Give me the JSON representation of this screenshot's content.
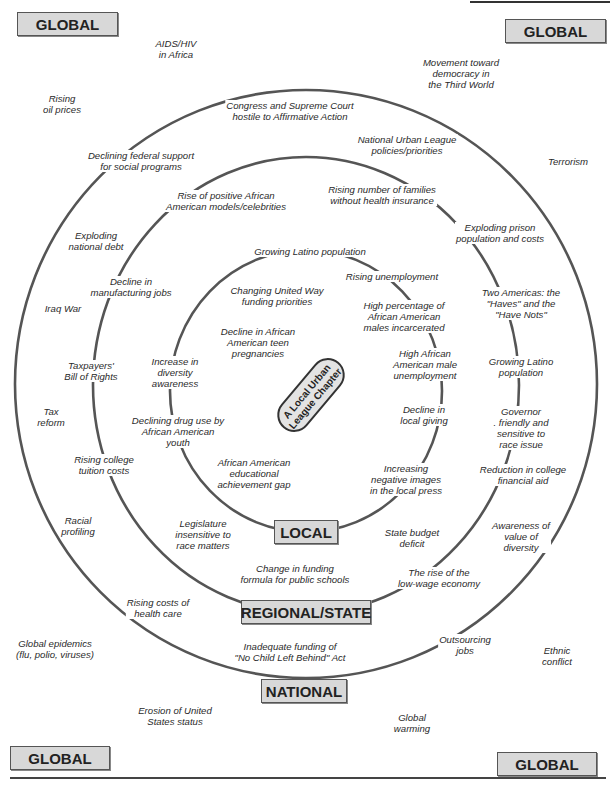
{
  "center": {
    "label": "A Local Urban\nLeague Chapter"
  },
  "levels": {
    "local": "LOCAL",
    "regional": "REGIONAL/STATE",
    "national": "NATIONAL",
    "global": "GLOBAL"
  },
  "global_boxes": [
    {
      "id": "top-left",
      "label": "GLOBAL"
    },
    {
      "id": "top-right",
      "label": "GLOBAL"
    },
    {
      "id": "bottom-left",
      "label": "GLOBAL"
    },
    {
      "id": "bottom-right",
      "label": "GLOBAL"
    }
  ],
  "factors": {
    "local": [
      "Growing Latino population",
      "Changing United Way\nfunding priorities",
      "Decline in African\nAmerican teen\npregnancies",
      "Increase in\ndiversity\nawareness",
      "Declining drug use by\nAfrican American\nyouth",
      "African American\neducational\nachievement gap",
      "Rising unemployment",
      "High percentage of\nAfrican American\nmales incarcerated",
      "High African\nAmerican male\nunemployment",
      "Decline in\nlocal giving",
      "Increasing\nnegative images\nin the local press"
    ],
    "regional": [
      "Rise of positive African\nAmerican models/celebrities",
      "Decline in\nmanufacturing jobs",
      "Taxpayers'\nBill of Rights",
      "Rising college\ntuition costs",
      "Legislature\ninsensitive to\nrace matters",
      "Change in funding\nformula for public schools",
      "State budget\ndeficit",
      "Rising number of families\nwithout health insurance",
      "Exploding prison\npopulation and costs",
      "Two Americas: the\n\"Haves\" and the\n\"Have Nots\"",
      "Growing Latino\npopulation",
      "Governor\n. friendly and\nsensitive to\nrace issue",
      "Reduction in college\nfinancial aid",
      "The rise of the\nlow-wage economy"
    ],
    "national": [
      "Congress and Supreme Court\nhostile to Affirmative Action",
      "Declining federal support\nfor social programs",
      "Exploding\nnational debt",
      "Iraq War",
      "Tax\nreform",
      "Racial\nprofiling",
      "Rising costs of\nhealth care",
      "Inadequate funding of\n\"No Child Left Behind\" Act",
      "National Urban League\npolicies/priorities",
      "Awareness of\nvalue of\ndiversity",
      "Outsourcing\njobs"
    ],
    "global": [
      "AIDS/HIV\nin Africa",
      "Rising\noil prices",
      "Movement toward\ndemocracy in\nthe Third World",
      "Terrorism",
      "Global epidemics\n(flu, polio, viruses)",
      "Erosion of United\nStates status",
      "Global\nwarming",
      "Ethnic\nconflict"
    ]
  },
  "colors": {
    "box_fill": "#d8d8d8",
    "ring_stroke": "#555555",
    "text": "#2a2a2a"
  }
}
